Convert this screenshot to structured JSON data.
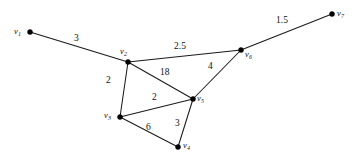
{
  "figure": {
    "kind": "weighted-undirected-graph",
    "width": 359,
    "height": 164,
    "background_color": "#ffffff",
    "stroke_color": "#1a1a1a",
    "vertex_color": "#000000"
  },
  "chart_data": {
    "type": "diagram",
    "title": "",
    "xlabel": "",
    "ylabel": "",
    "graph_type": "weighted undirected graph",
    "vertices": [
      {
        "id": "v1",
        "label": "v",
        "subscript": "1",
        "x": 30,
        "y": 32,
        "label_x": 14,
        "label_y": 27
      },
      {
        "id": "v2",
        "label": "v",
        "subscript": "2",
        "x": 128,
        "y": 62,
        "label_x": 120,
        "label_y": 47
      },
      {
        "id": "v3",
        "label": "v",
        "subscript": "3",
        "x": 120,
        "y": 117,
        "label_x": 104,
        "label_y": 111
      },
      {
        "id": "v4",
        "label": "v",
        "subscript": "4",
        "x": 178,
        "y": 147,
        "label_x": 183,
        "label_y": 141
      },
      {
        "id": "v5",
        "label": "v",
        "subscript": "5",
        "x": 193,
        "y": 99,
        "label_x": 197,
        "label_y": 94
      },
      {
        "id": "v6",
        "label": "v",
        "subscript": "6",
        "x": 241,
        "y": 50,
        "label_x": 245,
        "label_y": 50
      },
      {
        "id": "v7",
        "label": "v",
        "subscript": "7",
        "x": 332,
        "y": 14,
        "label_x": 337,
        "label_y": 9
      }
    ],
    "edges": [
      {
        "from": "v1",
        "to": "v2",
        "weight": "3",
        "label_x": 74,
        "label_y": 34
      },
      {
        "from": "v2",
        "to": "v6",
        "weight": "2.5",
        "label_x": 174,
        "label_y": 42
      },
      {
        "from": "v6",
        "to": "v7",
        "weight": "1.5",
        "label_x": 276,
        "label_y": 16
      },
      {
        "from": "v2",
        "to": "v5",
        "weight": "18",
        "label_x": 160,
        "label_y": 68
      },
      {
        "from": "v5",
        "to": "v6",
        "weight": "4",
        "label_x": 208,
        "label_y": 62
      },
      {
        "from": "v2",
        "to": "v3",
        "weight": "2",
        "label_x": 106,
        "label_y": 76
      },
      {
        "from": "v3",
        "to": "v5",
        "weight": "2",
        "label_x": 152,
        "label_y": 93
      },
      {
        "from": "v3",
        "to": "v4",
        "weight": "6",
        "label_x": 146,
        "label_y": 123
      },
      {
        "from": "v4",
        "to": "v5",
        "weight": "3",
        "label_x": 175,
        "label_y": 119
      }
    ]
  }
}
